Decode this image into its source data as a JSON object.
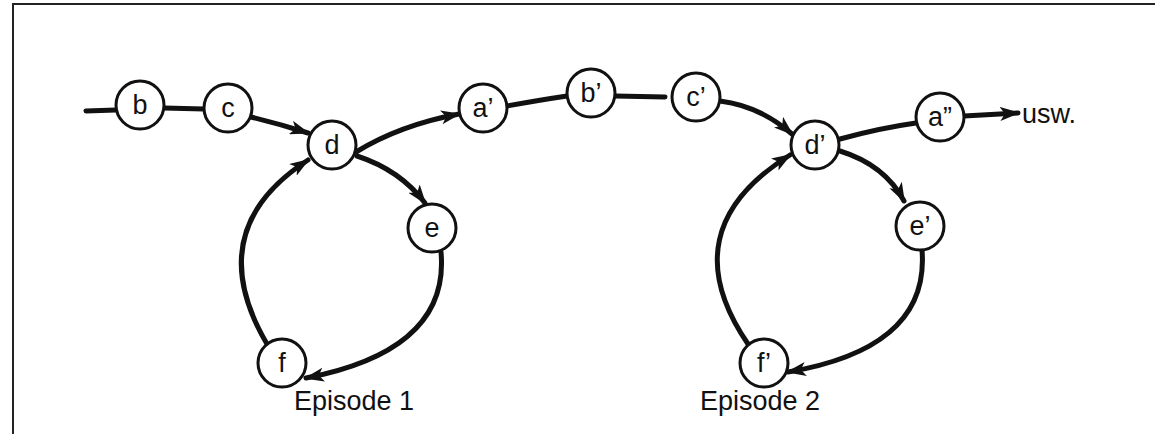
{
  "diagram": {
    "type": "state-sequence-with-loops",
    "colors": {
      "stroke": "#111111",
      "background": "#ffffff",
      "frame": "#222222"
    },
    "nodes": [
      {
        "id": "b",
        "label": "b",
        "x": 140,
        "y": 105
      },
      {
        "id": "c",
        "label": "c",
        "x": 228,
        "y": 108
      },
      {
        "id": "d",
        "label": "d",
        "x": 332,
        "y": 145
      },
      {
        "id": "e",
        "label": "e",
        "x": 432,
        "y": 228
      },
      {
        "id": "f",
        "label": "f",
        "x": 282,
        "y": 363
      },
      {
        "id": "a1",
        "label": "a’",
        "x": 483,
        "y": 108
      },
      {
        "id": "b1",
        "label": "b’",
        "x": 591,
        "y": 93
      },
      {
        "id": "c1",
        "label": "c’",
        "x": 696,
        "y": 97
      },
      {
        "id": "d1",
        "label": "d’",
        "x": 815,
        "y": 145
      },
      {
        "id": "e1",
        "label": "e’",
        "x": 920,
        "y": 226
      },
      {
        "id": "f1",
        "label": "f’",
        "x": 764,
        "y": 363
      },
      {
        "id": "a2",
        "label": "a”",
        "x": 940,
        "y": 117
      }
    ],
    "edges": [
      {
        "from": "start",
        "to": "b",
        "arrow": false
      },
      {
        "from": "b",
        "to": "c",
        "arrow": false
      },
      {
        "from": "c",
        "to": "d",
        "arrow": true
      },
      {
        "from": "d",
        "to": "a1",
        "arrow": true
      },
      {
        "from": "d",
        "to": "e",
        "arrow": true
      },
      {
        "from": "e",
        "to": "f",
        "arrow": true
      },
      {
        "from": "f",
        "to": "d",
        "arrow": true
      },
      {
        "from": "a1",
        "to": "b1",
        "arrow": false
      },
      {
        "from": "b1",
        "to": "c1",
        "arrow": false
      },
      {
        "from": "c1",
        "to": "d1",
        "arrow": true
      },
      {
        "from": "d1",
        "to": "a2",
        "arrow": false
      },
      {
        "from": "d1",
        "to": "e1",
        "arrow": true
      },
      {
        "from": "e1",
        "to": "f1",
        "arrow": true
      },
      {
        "from": "f1",
        "to": "d1",
        "arrow": true
      },
      {
        "from": "a2",
        "to": "usw",
        "arrow": true
      }
    ],
    "continuation_label": "usw.",
    "captions": [
      {
        "id": "episode1",
        "text": "Episode 1"
      },
      {
        "id": "episode2",
        "text": "Episode 2"
      }
    ]
  }
}
